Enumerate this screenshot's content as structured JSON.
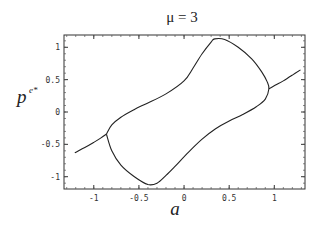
{
  "chart_data": {
    "type": "line",
    "title": "μ = 3",
    "xlabel": "a",
    "ylabel": "p",
    "ylabel_superscript": "e*",
    "xlim": [
      -1.33,
      1.34
    ],
    "ylim": [
      -1.19,
      1.19
    ],
    "xticks": [
      -1,
      -0.5,
      0,
      0.5,
      1
    ],
    "xtick_labels": [
      "-1",
      "-0.5",
      "0",
      "0.5",
      "1"
    ],
    "yticks": [
      -1,
      -0.5,
      0,
      0.5,
      1
    ],
    "ytick_labels": [
      "-1",
      "-0.5",
      "0",
      "0.5",
      "1"
    ],
    "grid": false,
    "legend": null,
    "series": [
      {
        "name": "left branch",
        "x": [
          -1.21,
          -1.1,
          -1.0,
          -0.92,
          -0.86
        ],
        "y": [
          -0.63,
          -0.55,
          -0.47,
          -0.4,
          -0.34
        ]
      },
      {
        "name": "right branch",
        "x": [
          0.94,
          1.02,
          1.1,
          1.2,
          1.29
        ],
        "y": [
          0.36,
          0.42,
          0.48,
          0.57,
          0.65
        ]
      },
      {
        "name": "closed loop",
        "x": [
          -0.86,
          -0.8,
          -0.7,
          -0.55,
          -0.4,
          -0.2,
          0.0,
          0.1,
          0.2,
          0.3,
          0.34,
          0.45,
          0.6,
          0.75,
          0.86,
          0.92,
          0.94,
          0.9,
          0.8,
          0.65,
          0.5,
          0.35,
          0.2,
          0.05,
          -0.1,
          -0.2,
          -0.3,
          -0.4,
          -0.55,
          -0.7,
          -0.8,
          -0.86
        ],
        "y": [
          -0.34,
          -0.2,
          -0.08,
          0.04,
          0.14,
          0.28,
          0.48,
          0.68,
          0.9,
          1.08,
          1.13,
          1.12,
          1.0,
          0.82,
          0.62,
          0.47,
          0.36,
          0.2,
          0.08,
          -0.04,
          -0.14,
          -0.26,
          -0.42,
          -0.62,
          -0.84,
          -0.98,
          -1.1,
          -1.12,
          -1.0,
          -0.82,
          -0.6,
          -0.34
        ]
      }
    ]
  }
}
